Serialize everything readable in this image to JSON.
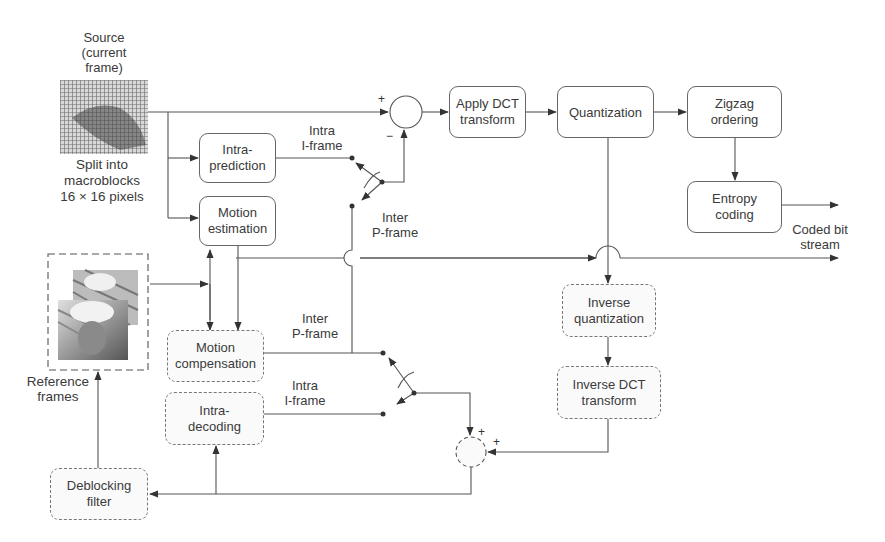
{
  "source": {
    "label": "Source\n(current\nframe)",
    "caption": "Split into\nmacroblocks\n16 × 16 pixels"
  },
  "encoder_blocks": {
    "intra_prediction": "Intra-\nprediction",
    "motion_estimation": "Motion\nestimation",
    "apply_dct": "Apply DCT\ntransform",
    "quantization": "Quantization",
    "zigzag": "Zigzag\nordering",
    "entropy": "Entropy\ncoding"
  },
  "decoder_blocks": {
    "inverse_quantization": "Inverse\nquantization",
    "inverse_dct": "Inverse DCT\ntransform",
    "motion_compensation": "Motion\ncompensation",
    "intra_decoding": "Intra-\ndecoding",
    "deblocking": "Deblocking\nfilter"
  },
  "reference": {
    "label": "Reference\nframes"
  },
  "switch_labels": {
    "top_intra": "Intra\nI-frame",
    "top_inter": "Inter\nP-frame",
    "bottom_inter": "Inter\nP-frame",
    "bottom_intra": "Intra\nI-frame"
  },
  "output": {
    "label": "Coded bit\nstream"
  },
  "signs": {
    "subtractor_plus": "+",
    "subtractor_minus": "−",
    "adder_plus_top": "+",
    "adder_plus_right": "+"
  }
}
